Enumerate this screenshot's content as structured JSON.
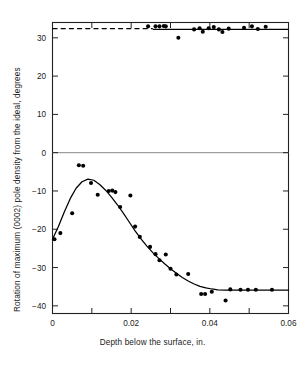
{
  "chart_data": {
    "type": "scatter",
    "title": "",
    "xlabel": "Depth below the surface, in.",
    "ylabel": "Rotation of maximum (0002) pole density from the ideal, degrees",
    "xlim": [
      0,
      0.06
    ],
    "ylim": [
      -42,
      34
    ],
    "grid": false,
    "legend": "none",
    "x_ticks": [
      {
        "value": 0,
        "label": "0",
        "major": true
      },
      {
        "value": 0.01,
        "label": "",
        "major": false
      },
      {
        "value": 0.02,
        "label": "0.02",
        "major": true
      },
      {
        "value": 0.03,
        "label": "",
        "major": false
      },
      {
        "value": 0.04,
        "label": "0.04",
        "major": true
      },
      {
        "value": 0.05,
        "label": "",
        "major": false
      },
      {
        "value": 0.06,
        "label": "0.06",
        "major": true
      }
    ],
    "y_ticks": [
      {
        "value": 30,
        "label": "30"
      },
      {
        "value": 20,
        "label": "20"
      },
      {
        "value": 10,
        "label": "10"
      },
      {
        "value": 0,
        "label": "0"
      },
      {
        "value": -10,
        "label": "−10"
      },
      {
        "value": -20,
        "label": "−20"
      },
      {
        "value": -30,
        "label": "−30"
      },
      {
        "value": -40,
        "label": "−40"
      }
    ],
    "zero_line": {
      "value": 0,
      "style": "solid",
      "color": "#888888"
    },
    "series": [
      {
        "name": "Upper branch points",
        "marker": "filled-circle",
        "color": "#000000",
        "points": [
          {
            "x": 0.0243,
            "y": 33.0
          },
          {
            "x": 0.0262,
            "y": 33.0
          },
          {
            "x": 0.0272,
            "y": 33.0
          },
          {
            "x": 0.0283,
            "y": 33.1
          },
          {
            "x": 0.0288,
            "y": 33.0
          },
          {
            "x": 0.032,
            "y": 30.0
          },
          {
            "x": 0.036,
            "y": 32.2
          },
          {
            "x": 0.0374,
            "y": 32.5
          },
          {
            "x": 0.0382,
            "y": 31.6
          },
          {
            "x": 0.0397,
            "y": 32.5
          },
          {
            "x": 0.041,
            "y": 32.8
          },
          {
            "x": 0.0423,
            "y": 32.2
          },
          {
            "x": 0.0432,
            "y": 31.5
          },
          {
            "x": 0.0448,
            "y": 32.4
          },
          {
            "x": 0.0487,
            "y": 32.6
          },
          {
            "x": 0.0507,
            "y": 33.0
          },
          {
            "x": 0.0522,
            "y": 32.3
          },
          {
            "x": 0.0542,
            "y": 32.9
          }
        ]
      },
      {
        "name": "Lower branch points",
        "marker": "filled-circle",
        "color": "#000000",
        "points": [
          {
            "x": 0.0005,
            "y": -22.6
          },
          {
            "x": 0.002,
            "y": -21.0
          },
          {
            "x": 0.005,
            "y": -15.8
          },
          {
            "x": 0.0067,
            "y": -3.3
          },
          {
            "x": 0.0078,
            "y": -3.4
          },
          {
            "x": 0.0098,
            "y": -7.9
          },
          {
            "x": 0.0115,
            "y": -11.0
          },
          {
            "x": 0.0143,
            "y": -10.0
          },
          {
            "x": 0.0152,
            "y": -9.9
          },
          {
            "x": 0.016,
            "y": -10.3
          },
          {
            "x": 0.0172,
            "y": -14.2
          },
          {
            "x": 0.0198,
            "y": -11.2
          },
          {
            "x": 0.021,
            "y": -19.3
          },
          {
            "x": 0.0222,
            "y": -22.0
          },
          {
            "x": 0.0248,
            "y": -24.6
          },
          {
            "x": 0.0262,
            "y": -26.5
          },
          {
            "x": 0.0272,
            "y": -28.1
          },
          {
            "x": 0.0288,
            "y": -26.6
          },
          {
            "x": 0.03,
            "y": -30.3
          },
          {
            "x": 0.0315,
            "y": -31.8
          },
          {
            "x": 0.0345,
            "y": -31.7
          },
          {
            "x": 0.0378,
            "y": -36.9
          },
          {
            "x": 0.0388,
            "y": -36.9
          },
          {
            "x": 0.0405,
            "y": -36.3
          },
          {
            "x": 0.044,
            "y": -38.6
          },
          {
            "x": 0.0452,
            "y": -35.7
          },
          {
            "x": 0.0478,
            "y": -35.8
          },
          {
            "x": 0.0497,
            "y": -35.8
          },
          {
            "x": 0.0517,
            "y": -35.8
          },
          {
            "x": 0.0558,
            "y": -35.8
          }
        ]
      }
    ],
    "fit_curves": [
      {
        "name": "Upper asymptote (dashed)",
        "style": "dashed",
        "color": "#000000",
        "y_value": 32.4,
        "x_from": 0.0,
        "x_to": 0.0255
      },
      {
        "name": "Upper fit (solid)",
        "style": "solid",
        "color": "#000000",
        "y_value": 32.2,
        "x_from": 0.0255,
        "x_to": 0.06
      },
      {
        "name": "Lower fit curve",
        "style": "solid",
        "color": "#000000",
        "points": [
          {
            "x": 0.0,
            "y": -22.6
          },
          {
            "x": 0.0015,
            "y": -19.3
          },
          {
            "x": 0.003,
            "y": -15.5
          },
          {
            "x": 0.0045,
            "y": -12.0
          },
          {
            "x": 0.006,
            "y": -9.3
          },
          {
            "x": 0.0075,
            "y": -7.6
          },
          {
            "x": 0.009,
            "y": -6.9
          },
          {
            "x": 0.0105,
            "y": -7.2
          },
          {
            "x": 0.012,
            "y": -8.3
          },
          {
            "x": 0.0135,
            "y": -9.8
          },
          {
            "x": 0.015,
            "y": -11.6
          },
          {
            "x": 0.0165,
            "y": -13.6
          },
          {
            "x": 0.018,
            "y": -15.8
          },
          {
            "x": 0.0195,
            "y": -18.1
          },
          {
            "x": 0.021,
            "y": -20.4
          },
          {
            "x": 0.0225,
            "y": -22.5
          },
          {
            "x": 0.024,
            "y": -24.4
          },
          {
            "x": 0.0255,
            "y": -26.1
          },
          {
            "x": 0.027,
            "y": -27.6
          },
          {
            "x": 0.0285,
            "y": -29.0
          },
          {
            "x": 0.03,
            "y": -30.3
          },
          {
            "x": 0.0315,
            "y": -31.5
          },
          {
            "x": 0.033,
            "y": -32.6
          },
          {
            "x": 0.0345,
            "y": -33.5
          },
          {
            "x": 0.036,
            "y": -34.3
          },
          {
            "x": 0.0375,
            "y": -34.9
          },
          {
            "x": 0.039,
            "y": -35.3
          },
          {
            "x": 0.0405,
            "y": -35.6
          },
          {
            "x": 0.042,
            "y": -35.8
          },
          {
            "x": 0.044,
            "y": -35.9
          },
          {
            "x": 0.047,
            "y": -35.9
          },
          {
            "x": 0.052,
            "y": -35.9
          },
          {
            "x": 0.06,
            "y": -35.9
          }
        ]
      }
    ]
  }
}
